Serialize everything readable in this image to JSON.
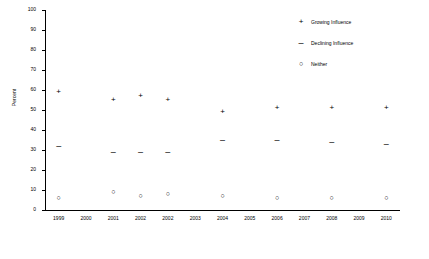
{
  "chart_data": {
    "type": "scatter",
    "title": "",
    "xlabel": "",
    "ylabel": "Percent",
    "ylim": [
      0,
      100
    ],
    "ytick_labels": [
      "0",
      "10",
      "20",
      "30",
      "40",
      "50",
      "60",
      "70",
      "80",
      "90",
      "100"
    ],
    "ytick_values": [
      0,
      10,
      20,
      30,
      40,
      50,
      60,
      70,
      80,
      90,
      100
    ],
    "grid": false,
    "legend_position": "top-right",
    "categories": [
      "1999",
      "2000",
      "2001",
      "2002",
      "2002",
      "2003",
      "2004",
      "2005",
      "2006",
      "2007",
      "2008",
      "2009",
      "2010"
    ],
    "series": [
      {
        "name": "Growing Influence",
        "symbol": "+",
        "points": [
          {
            "x": "1999",
            "y": 59
          },
          {
            "x": "2001",
            "y": 55
          },
          {
            "x": "2002",
            "y": 57
          },
          {
            "x": "2002b",
            "y": 55
          },
          {
            "x": "2004",
            "y": 49
          },
          {
            "x": "2006",
            "y": 51
          },
          {
            "x": "2008",
            "y": 51
          },
          {
            "x": "2010",
            "y": 51
          }
        ]
      },
      {
        "name": "Declining Influence",
        "symbol": "–",
        "points": [
          {
            "x": "1999",
            "y": 32
          },
          {
            "x": "2001",
            "y": 29
          },
          {
            "x": "2002",
            "y": 29
          },
          {
            "x": "2002b",
            "y": 29
          },
          {
            "x": "2004",
            "y": 35
          },
          {
            "x": "2006",
            "y": 35
          },
          {
            "x": "2008",
            "y": 34
          },
          {
            "x": "2010",
            "y": 33
          }
        ]
      },
      {
        "name": "Neither",
        "symbol": "○",
        "points": [
          {
            "x": "1999",
            "y": 6
          },
          {
            "x": "2001",
            "y": 9
          },
          {
            "x": "2002",
            "y": 7
          },
          {
            "x": "2002b",
            "y": 8
          },
          {
            "x": "2004",
            "y": 7
          },
          {
            "x": "2006",
            "y": 6
          },
          {
            "x": "2008",
            "y": 6
          },
          {
            "x": "2010",
            "y": 6
          }
        ]
      }
    ],
    "legend": [
      {
        "symbol": "+",
        "label": "Growing Influence"
      },
      {
        "symbol": "–",
        "label": "Declining Influence"
      },
      {
        "symbol": "○",
        "label": "Neither"
      }
    ]
  }
}
